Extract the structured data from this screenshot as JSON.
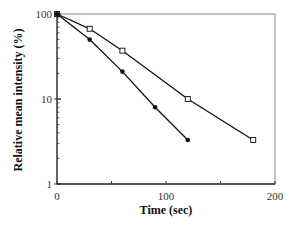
{
  "chart_data": {
    "type": "line",
    "title": "",
    "xlabel": "Time (sec)",
    "ylabel": "Relative mean intensity (%)",
    "xlim": [
      0,
      200
    ],
    "ylim": [
      1,
      100
    ],
    "yscale": "log",
    "xticks": [
      0,
      100,
      200
    ],
    "xtick_labels": [
      "0",
      "100",
      "200"
    ],
    "yticks": [
      1,
      10,
      100
    ],
    "ytick_labels": [
      "1",
      "10",
      "100"
    ],
    "grid": false,
    "legend": null,
    "series": [
      {
        "name": "open-squares",
        "marker": "open-square",
        "x": [
          0,
          30,
          60,
          120,
          180
        ],
        "values": [
          100,
          67,
          37,
          10,
          3.3
        ]
      },
      {
        "name": "filled-circles",
        "marker": "filled-circle",
        "x": [
          0,
          30,
          60,
          90,
          120
        ],
        "values": [
          100,
          50,
          21,
          8,
          3.3
        ]
      }
    ]
  },
  "colors": {
    "axis": "#333333",
    "line": "#111111"
  }
}
